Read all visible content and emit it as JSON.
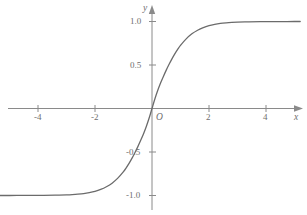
{
  "chart_data": {
    "type": "line",
    "title": "",
    "subtitle": "",
    "xlabel": "x",
    "ylabel": "y",
    "origin_label": "O",
    "grid": false,
    "legend": null,
    "xlim": [
      -5.35,
      5.2
    ],
    "ylim": [
      -1.23,
      1.2
    ],
    "x_ticks": [
      -4,
      -2,
      2,
      4
    ],
    "x_tick_labels": [
      "-4",
      "-2",
      "2",
      "4"
    ],
    "y_ticks": [
      1.0,
      0.5,
      -0.5,
      -1.0
    ],
    "y_tick_labels": [
      "1.0",
      "0.5",
      "-0.5",
      "-1.0"
    ],
    "asymptotes": [
      1.0,
      -1.0
    ],
    "series": [
      {
        "name": "sigmoid",
        "x": [
          -5.35,
          -5.0,
          -4.6,
          -4.2,
          -3.8,
          -3.4,
          -3.0,
          -2.8,
          -2.6,
          -2.4,
          -2.2,
          -2.0,
          -1.8,
          -1.6,
          -1.4,
          -1.2,
          -1.0,
          -0.9,
          -0.8,
          -0.7,
          -0.6,
          -0.5,
          -0.4,
          -0.3,
          -0.2,
          -0.1,
          0.0,
          0.1,
          0.2,
          0.3,
          0.4,
          0.5,
          0.6,
          0.7,
          0.8,
          0.9,
          1.0,
          1.2,
          1.4,
          1.6,
          1.8,
          2.0,
          2.2,
          2.4,
          2.6,
          2.8,
          3.0,
          3.4,
          3.8,
          4.2,
          4.6,
          5.0,
          5.2
        ],
        "y": [
          -1.0,
          -1.0,
          -0.999,
          -0.999,
          -0.998,
          -0.996,
          -0.993,
          -0.99,
          -0.985,
          -0.978,
          -0.967,
          -0.952,
          -0.93,
          -0.899,
          -0.858,
          -0.8,
          -0.726,
          -0.679,
          -0.628,
          -0.571,
          -0.508,
          -0.441,
          -0.369,
          -0.293,
          -0.207,
          -0.11,
          0.0,
          0.11,
          0.207,
          0.293,
          0.369,
          0.441,
          0.508,
          0.571,
          0.628,
          0.679,
          0.726,
          0.8,
          0.858,
          0.899,
          0.93,
          0.952,
          0.967,
          0.978,
          0.985,
          0.99,
          0.993,
          0.996,
          0.998,
          0.999,
          0.999,
          1.0,
          1.0
        ]
      }
    ]
  },
  "style": {
    "curve_color": "#6b6b6b",
    "axis_color": "#8a8a8a",
    "text_color": "#6e6e6e",
    "background": "#ffffff"
  },
  "geometry": {
    "origin_px_x": 152,
    "origin_px_y": 108.5,
    "px_per_x_unit": 28.5,
    "px_per_y_unit": 87.0
  }
}
